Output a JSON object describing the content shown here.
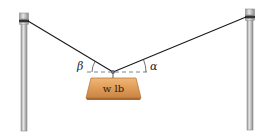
{
  "diagram": {
    "weight_label": "w lb",
    "angle_left": "β",
    "angle_right": "α",
    "colors": {
      "background": "#ffffff",
      "cable": "#1a1a1a",
      "pole": "#b8b8b8",
      "pole_dark": "#8a8a8a",
      "weight_fill": "#e0a262",
      "weight_dark": "#c47d3c",
      "dashed_line": "#556677"
    }
  }
}
